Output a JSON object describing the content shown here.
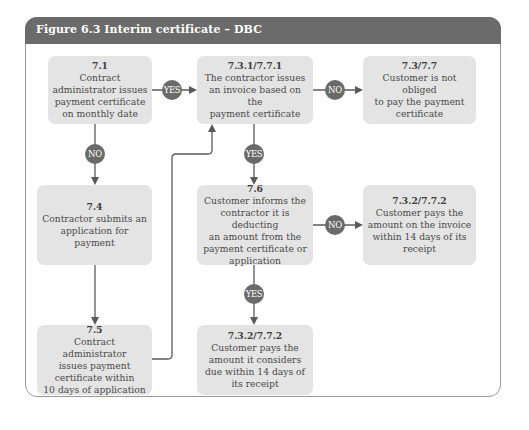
{
  "figure": {
    "title": "Figure 6.3  Interim certificate – DBC",
    "colors": {
      "header": "#6b6b6b",
      "box": "#e4e4e4",
      "badge": "#6a6a6a",
      "line": "#5a5a5a"
    }
  },
  "nodes": {
    "n7_1": {
      "ref": "7.1",
      "text": "Contract\nadministrator issues\npayment certificate\non monthly date"
    },
    "n7_3_1": {
      "ref": "7.3.1/7.7.1",
      "text": "The contractor issues\nan invoice based on the\npayment certificate"
    },
    "n7_3": {
      "ref": "7.3/7.7",
      "text": "Customer is not obliged\nto pay the payment\ncertificate"
    },
    "n7_4": {
      "ref": "7.4",
      "text": "Contractor submits an\napplication for\npayment"
    },
    "n7_6": {
      "ref": "7.6",
      "text": "Customer informs the\ncontractor it is deducting\nan amount from the\npayment certificate or\napplication"
    },
    "n7_3_2a": {
      "ref": "7.3.2/7.7.2",
      "text": "Customer pays the\namount on the invoice\nwithin 14 days of its\nreceipt"
    },
    "n7_5": {
      "ref": "7.5",
      "text": "Contract administrator\nissues payment\ncertificate within\n10 days of application"
    },
    "n7_3_2b": {
      "ref": "7.3.2/7.7.2",
      "text": "Customer pays the\namount it considers\ndue within 14 days of\nits receipt"
    }
  },
  "edges": [
    {
      "from": "7.1",
      "to": "7.3.1/7.7.1",
      "label": "YES"
    },
    {
      "from": "7.1",
      "to": "7.4",
      "label": "NO"
    },
    {
      "from": "7.3.1/7.7.1",
      "to": "7.3/7.7",
      "label": "NO"
    },
    {
      "from": "7.3.1/7.7.1",
      "to": "7.6",
      "label": "YES"
    },
    {
      "from": "7.4",
      "to": "7.5",
      "label": ""
    },
    {
      "from": "7.5",
      "to": "7.3.1/7.7.1",
      "label": ""
    },
    {
      "from": "7.6",
      "to": "7.3.2/7.7.2 (invoice)",
      "label": "NO"
    },
    {
      "from": "7.6",
      "to": "7.3.2/7.7.2 (considers)",
      "label": "YES"
    }
  ],
  "badges": {
    "yes": "YES",
    "no": "NO"
  }
}
